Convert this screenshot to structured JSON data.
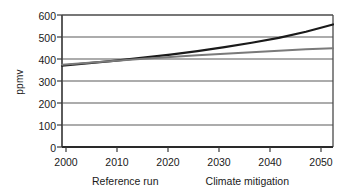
{
  "chart_data": {
    "type": "line",
    "title": "",
    "xlabel": "",
    "ylabel": "ppmv",
    "xlim": [
      2000,
      2050
    ],
    "ylim": [
      0,
      600
    ],
    "xticks": [
      2000,
      2010,
      2020,
      2030,
      2040,
      2050
    ],
    "yticks": [
      0,
      100,
      200,
      300,
      400,
      500,
      600
    ],
    "grid": "horizontal",
    "legend_position": "bottom",
    "x": [
      2000,
      2005,
      2010,
      2015,
      2020,
      2025,
      2030,
      2035,
      2040,
      2045,
      2050
    ],
    "series": [
      {
        "name": "Reference run",
        "color": "#1a1a1a",
        "width": 2.2,
        "values": [
          370,
          381,
          393,
          406,
          420,
          436,
          454,
          474,
          496,
          524,
          557
        ]
      },
      {
        "name": "Climate mitigation",
        "color": "#7a7a7a",
        "width": 2.0,
        "values": [
          374,
          383,
          392,
          401,
          409,
          417,
          424,
          431,
          438,
          444,
          449
        ]
      }
    ]
  },
  "axis": {
    "y_title": "ppmv",
    "y_tick_labels": [
      "600",
      "500",
      "400",
      "300",
      "200",
      "100",
      "0"
    ],
    "x_tick_labels": [
      "2000",
      "2010",
      "2020",
      "2030",
      "2040",
      "2050"
    ]
  },
  "legend": {
    "items": [
      {
        "label": "Reference run",
        "color": "#1a1a1a"
      },
      {
        "label": "Climate mitigation",
        "color": "#7a7a7a"
      }
    ]
  },
  "style": {
    "frame_color": "#4a4a4a",
    "grid_color": "#5a5a5a",
    "background": "#ffffff"
  }
}
